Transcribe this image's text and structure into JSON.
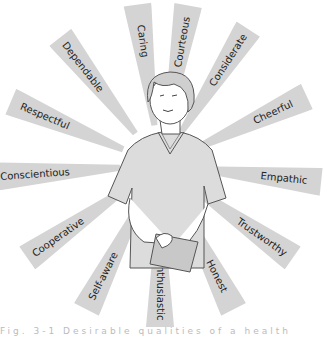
{
  "diagram": {
    "type": "radial-trait-diagram",
    "center_figure": "healthcare worker in v-neck top holding clipboard",
    "band_color": "#d4d4d4",
    "text_color": "#222222",
    "traits": [
      {
        "label": "Caring",
        "angle": -98
      },
      {
        "label": "Courteous",
        "angle": -80
      },
      {
        "label": "Considerate",
        "angle": -57
      },
      {
        "label": "Cheerful",
        "angle": -25
      },
      {
        "label": "Empathic",
        "angle": 6
      },
      {
        "label": "Trustworthy",
        "angle": 35
      },
      {
        "label": "Honest",
        "angle": 63
      },
      {
        "label": "Enthusiastic",
        "angle": 90
      },
      {
        "label": "Self-aware",
        "angle": 117
      },
      {
        "label": "Cooperative",
        "angle": 145
      },
      {
        "label": "Conscientious",
        "angle": 176
      },
      {
        "label": "Respectful",
        "angle": -157
      },
      {
        "label": "Dependable",
        "angle": -128
      }
    ]
  },
  "caption": {
    "text": "Fig. 3-1 Desirable qualities of a health care worker"
  }
}
